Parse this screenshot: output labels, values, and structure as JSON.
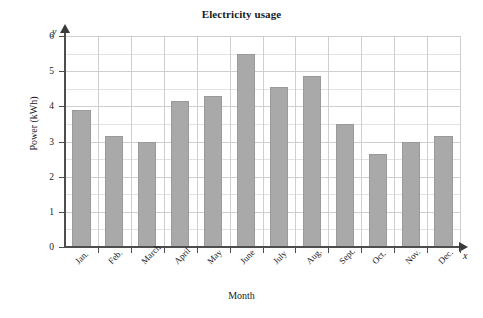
{
  "chart_data": {
    "type": "bar",
    "title": "Electricity usage",
    "xlabel": "Month",
    "ylabel": "Power (kWh)",
    "x_axis_symbol": "x",
    "y_axis_symbol": "y",
    "categories": [
      "Jan.",
      "Feb.",
      "March",
      "April",
      "May",
      "June",
      "July",
      "Aug.",
      "Sept.",
      "Oct.",
      "Nov.",
      "Dec."
    ],
    "values": [
      3.9,
      3.15,
      3.0,
      4.15,
      4.3,
      5.5,
      4.55,
      4.85,
      3.5,
      2.65,
      3.0,
      3.15
    ],
    "ylim": [
      0,
      6
    ],
    "ytick_labels": [
      "0",
      "1",
      "2",
      "3",
      "4",
      "5",
      "6"
    ],
    "ytick_values": [
      0,
      1,
      2,
      3,
      4,
      5,
      6
    ],
    "y_minor_step": 0.5,
    "grid": true,
    "legend": null,
    "bar_color": "#a9a9a9",
    "grid_color": "#cfcfcf",
    "axis_color": "#4d4d4d"
  }
}
